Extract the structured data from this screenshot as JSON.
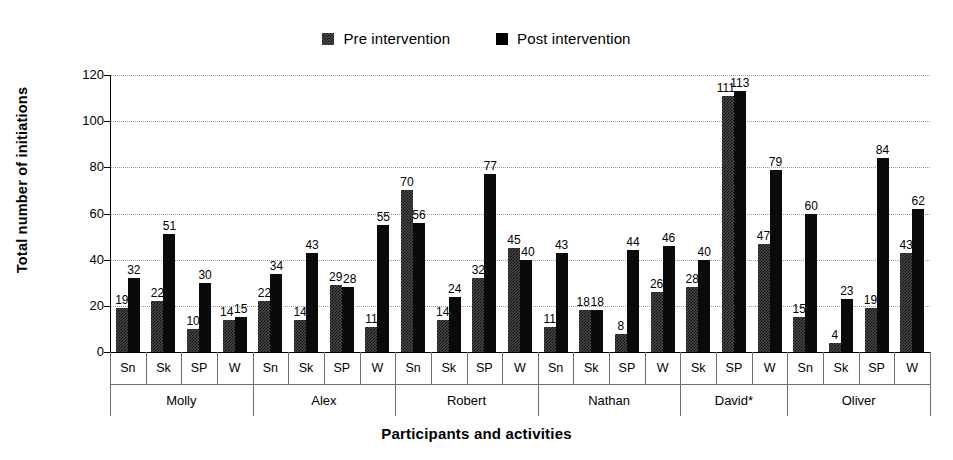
{
  "chart_data": {
    "type": "bar",
    "title": "",
    "xlabel": "Participants and activities",
    "ylabel": "Total number of initiations",
    "ylim": [
      0,
      120
    ],
    "yticks": [
      0,
      20,
      40,
      60,
      80,
      100,
      120
    ],
    "grid": true,
    "legend_position": "top-center",
    "categories": [
      "Sn",
      "Sk",
      "SP",
      "W",
      "Sn",
      "Sk",
      "SP",
      "W",
      "Sn",
      "Sk",
      "SP",
      "W",
      "Sn",
      "Sk",
      "SP",
      "W",
      "Sk",
      "SP",
      "W",
      "Sn",
      "Sk",
      "SP",
      "W"
    ],
    "groups": [
      {
        "name": "Molly",
        "activities": [
          "Sn",
          "Sk",
          "SP",
          "W"
        ]
      },
      {
        "name": "Alex",
        "activities": [
          "Sn",
          "Sk",
          "SP",
          "W"
        ]
      },
      {
        "name": "Robert",
        "activities": [
          "Sn",
          "Sk",
          "SP",
          "W"
        ]
      },
      {
        "name": "Nathan",
        "activities": [
          "Sn",
          "Sk",
          "SP",
          "W"
        ]
      },
      {
        "name": "David*",
        "activities": [
          "Sk",
          "SP",
          "W"
        ]
      },
      {
        "name": "Oliver",
        "activities": [
          "Sn",
          "Sk",
          "SP",
          "W"
        ]
      }
    ],
    "series": [
      {
        "name": "Pre intervention",
        "color": "#4a4a4a",
        "values": [
          19,
          22,
          10,
          14,
          22,
          14,
          29,
          11,
          70,
          14,
          32,
          45,
          11,
          18,
          8,
          26,
          28,
          111,
          47,
          15,
          4,
          19,
          43
        ]
      },
      {
        "name": "Post intervention",
        "color": "#0a0a0a",
        "values": [
          32,
          51,
          30,
          15,
          34,
          43,
          28,
          55,
          56,
          24,
          77,
          40,
          43,
          18,
          44,
          46,
          40,
          113,
          79,
          60,
          23,
          84,
          62
        ]
      }
    ]
  },
  "legend": {
    "entries": [
      {
        "label": "Pre intervention"
      },
      {
        "label": "Post intervention"
      }
    ]
  },
  "axes": {
    "y_title": "Total number of initiations",
    "x_title": "Participants and activities"
  }
}
